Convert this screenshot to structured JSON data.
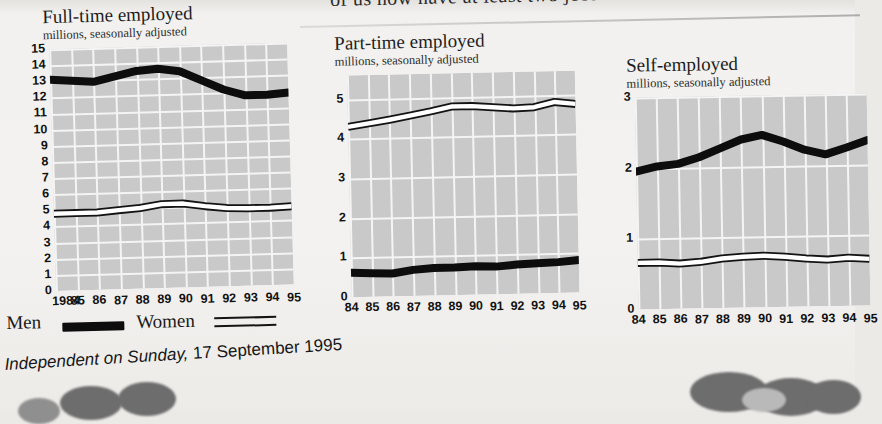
{
  "headline": {
    "text": "of us now have at least two jobs"
  },
  "legend": {
    "men_label": "Men",
    "women_label": "Women"
  },
  "footer": {
    "source_italic": "Independent on Sunday,",
    "date": "17 September 1995"
  },
  "chart_data": [
    {
      "type": "line",
      "title": "Full-time employed",
      "subtitle": "millions, seasonally adjusted",
      "xlabel": "",
      "ylabel": "millions",
      "ylim": [
        0,
        15
      ],
      "yticks": [
        0,
        1,
        2,
        3,
        4,
        5,
        6,
        7,
        8,
        9,
        10,
        11,
        12,
        13,
        14,
        15
      ],
      "grid": true,
      "legend_position": "below-figure",
      "categories": [
        "1984",
        "85",
        "86",
        "87",
        "88",
        "89",
        "90",
        "91",
        "92",
        "93",
        "94",
        "95"
      ],
      "series": [
        {
          "name": "Men",
          "values": [
            13.1,
            13.0,
            12.9,
            13.2,
            13.5,
            13.6,
            13.4,
            12.8,
            12.2,
            11.8,
            11.8,
            11.9
          ]
        },
        {
          "name": "Women",
          "values": [
            4.8,
            4.8,
            4.8,
            4.9,
            5.0,
            5.2,
            5.2,
            5.0,
            4.85,
            4.8,
            4.8,
            4.85
          ]
        }
      ]
    },
    {
      "type": "line",
      "title": "Part-time employed",
      "subtitle": "millions, seasonally adjusted",
      "xlabel": "",
      "ylabel": "millions",
      "ylim": [
        0,
        5.6
      ],
      "yticks": [
        0,
        1,
        2,
        3,
        4,
        5
      ],
      "grid": true,
      "categories": [
        "84",
        "85",
        "86",
        "87",
        "88",
        "89",
        "90",
        "91",
        "92",
        "93",
        "94",
        "95"
      ],
      "series": [
        {
          "name": "Men",
          "values": [
            0.62,
            0.6,
            0.58,
            0.66,
            0.7,
            0.7,
            0.72,
            0.7,
            0.74,
            0.76,
            0.78,
            0.82
          ]
        },
        {
          "name": "Women",
          "values": [
            4.3,
            4.38,
            4.46,
            4.55,
            4.65,
            4.76,
            4.76,
            4.72,
            4.68,
            4.7,
            4.82,
            4.76
          ]
        }
      ]
    },
    {
      "type": "line",
      "title": "Self-employed",
      "subtitle": "millions, seasonally adjusted",
      "xlabel": "",
      "ylabel": "millions",
      "ylim": [
        0,
        3
      ],
      "yticks": [
        0,
        1,
        2,
        3
      ],
      "grid": true,
      "categories": [
        "84",
        "85",
        "86",
        "87",
        "88",
        "89",
        "90",
        "91",
        "92",
        "93",
        "94",
        "95"
      ],
      "series": [
        {
          "name": "Men",
          "values": [
            1.95,
            2.02,
            2.05,
            2.14,
            2.26,
            2.38,
            2.44,
            2.34,
            2.22,
            2.15,
            2.24,
            2.34
          ]
        },
        {
          "name": "Women",
          "values": [
            0.66,
            0.66,
            0.64,
            0.66,
            0.7,
            0.72,
            0.73,
            0.71,
            0.68,
            0.66,
            0.68,
            0.66
          ]
        }
      ]
    }
  ]
}
